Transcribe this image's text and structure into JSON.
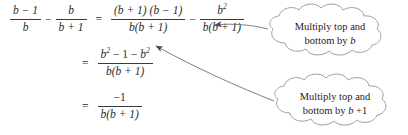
{
  "figure": {
    "background": "#ffffff",
    "ink_color": "#25262a",
    "cloud_stroke": "#8d8f95"
  },
  "equations": [
    {
      "id": "line-1",
      "lhs": {
        "fraction_1": {
          "numerator": "b − 1",
          "denominator": "b"
        },
        "operator": "−",
        "fraction_2": {
          "numerator": "b",
          "denominator": "b + 1"
        }
      },
      "relation": "=",
      "rhs": {
        "fraction_1": {
          "numerator": "(b + 1) (b − 1)",
          "denominator": "b(b + 1)"
        },
        "operator": "−",
        "fraction_2": {
          "numerator_base": "b",
          "numerator_exponent": "2",
          "denominator": "b(b + 1)"
        }
      }
    },
    {
      "id": "line-2",
      "relation": "=",
      "fraction": {
        "numerator_part_1": "b",
        "numerator_exponent_1": "2",
        "numerator_middle": " − 1 − ",
        "numerator_part_2": "b",
        "numerator_exponent_2": "2",
        "denominator": "b(b + 1)"
      }
    },
    {
      "id": "line-3",
      "relation": "=",
      "fraction": {
        "numerator": "−1",
        "denominator": "b(b + 1)"
      }
    }
  ],
  "callouts": [
    {
      "id": "callout-top",
      "line_1": "Multiply top and",
      "line_2_prefix": "bottom by ",
      "line_2_variable": "b",
      "line_2_suffix": "",
      "points_to": "second term of right-hand side of line 1"
    },
    {
      "id": "callout-bottom",
      "line_1": "Multiply top and",
      "line_2_prefix": "bottom by ",
      "line_2_variable": "b",
      "line_2_suffix": " +1",
      "points_to": "first term of right-hand side of line 1"
    }
  ],
  "arrows": [
    {
      "id": "arrow-top",
      "from": "callout-top",
      "to": "b-squared-over-b-b-plus-1",
      "style": "solid-thin"
    },
    {
      "id": "arrow-bottom",
      "from": "callout-bottom",
      "to": "b-squared-numerator-term",
      "style": "solid-thin"
    }
  ]
}
